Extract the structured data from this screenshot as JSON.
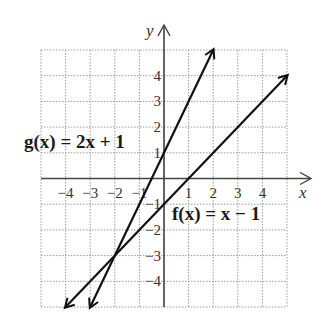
{
  "chart_data": {
    "type": "line",
    "title": "",
    "xlabel": "x",
    "ylabel": "y",
    "xlim": [
      -5,
      5
    ],
    "ylim": [
      -5,
      5
    ],
    "grid": true,
    "x_ticks": [
      -4,
      -3,
      -2,
      -1,
      1,
      2,
      3,
      4
    ],
    "y_ticks": [
      -4,
      -3,
      -2,
      -1,
      1,
      2,
      3,
      4
    ],
    "x_tick_labels": [
      "−4",
      "−3",
      "−2",
      "−1",
      "1",
      "2",
      "3",
      "4"
    ],
    "y_tick_labels": [
      "−4",
      "−3",
      "−2",
      "−1",
      "1",
      "2",
      "3",
      "4"
    ],
    "series": [
      {
        "name": "g(x) = 2x + 1",
        "label_text": "g(x) = 2x + 1",
        "slope": 2,
        "intercept": 1,
        "points": [
          [
            -3,
            -5
          ],
          [
            2,
            5
          ]
        ]
      },
      {
        "name": "f(x) = x − 1",
        "label_text": "f(x) = x − 1",
        "slope": 1,
        "intercept": -1,
        "points": [
          [
            -4,
            -5
          ],
          [
            5,
            4
          ]
        ]
      }
    ],
    "annotations": [
      {
        "text": "g(x) = 2x + 1",
        "position": "left of y-axis, near y=1"
      },
      {
        "text": "f(x) = x − 1",
        "position": "right of y-axis, near y=−1.5"
      }
    ],
    "intersection": [
      -2,
      -3
    ]
  },
  "labels": {
    "x_axis": "x",
    "y_axis": "y",
    "g_label": "g(x) = 2x + 1",
    "f_label": "f(x) = x − 1"
  },
  "colors": {
    "grid": "#9a9a9a",
    "axis": "#444444",
    "line": "#111111"
  }
}
